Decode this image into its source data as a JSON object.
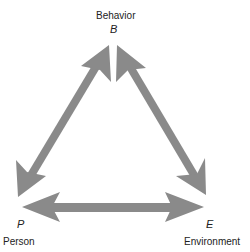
{
  "diagram": {
    "type": "reciprocal-determinism-triangle",
    "arrow_color": "#8a8a8a",
    "nodes": {
      "behavior": {
        "name": "Behavior",
        "letter": "B"
      },
      "person": {
        "name": "Person",
        "letter": "P"
      },
      "environment": {
        "name": "Environment",
        "letter": "E"
      }
    },
    "edges": [
      {
        "from": "P",
        "to": "B",
        "direction": "bidirectional"
      },
      {
        "from": "B",
        "to": "E",
        "direction": "bidirectional"
      },
      {
        "from": "P",
        "to": "E",
        "direction": "bidirectional"
      }
    ]
  }
}
